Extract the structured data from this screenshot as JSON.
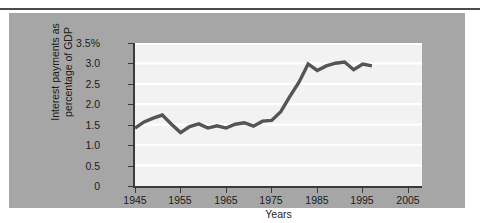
{
  "figure": {
    "panel_color": "#a6a6a6",
    "plot_background": "#f2f2f2",
    "gridline_color": "#ffffff",
    "axis_color": "#3a3a3a",
    "series_color": "#555555"
  },
  "chart_data": {
    "type": "line",
    "title": "",
    "xlabel": "Years",
    "ylabel": "Interest payments as\npercentage of GDP",
    "ylabel_line1": "Interest payments as",
    "ylabel_line2": "percentage of GDP",
    "xlim": [
      1945,
      2008
    ],
    "ylim": [
      0,
      3.75
    ],
    "grid": true,
    "legend": "none",
    "xticks": [
      1945,
      1955,
      1965,
      1975,
      1985,
      1995,
      2005
    ],
    "xtick_labels": [
      "1945",
      "1955",
      "1965",
      "1975",
      "1985",
      "1995",
      "2005"
    ],
    "yticks": [
      0,
      0.5,
      1.0,
      1.5,
      2.0,
      2.5,
      3.0,
      3.5
    ],
    "ytick_labels": [
      "0",
      "0.5",
      "1.0",
      "1.5",
      "2.0",
      "2.5",
      "3.0",
      "3.5%"
    ],
    "series": [
      {
        "name": "Interest payments as percentage of GDP",
        "color": "#555555",
        "x": [
          1945,
          1947,
          1949,
          1951,
          1953,
          1955,
          1957,
          1959,
          1961,
          1963,
          1965,
          1967,
          1969,
          1971,
          1973,
          1975,
          1977,
          1979,
          1981,
          1983,
          1985,
          1987,
          1989,
          1991,
          1993,
          1995,
          1997
        ],
        "values": [
          1.52,
          1.68,
          1.78,
          1.86,
          1.62,
          1.4,
          1.56,
          1.63,
          1.52,
          1.58,
          1.52,
          1.62,
          1.66,
          1.57,
          1.7,
          1.72,
          1.95,
          2.35,
          2.72,
          3.2,
          3.03,
          3.15,
          3.22,
          3.25,
          3.05,
          3.2,
          3.15
        ]
      }
    ]
  }
}
